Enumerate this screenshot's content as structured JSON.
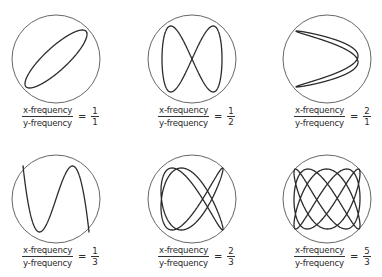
{
  "figure": {
    "stroke_color": "#2b2b2b",
    "circle_color": "#555555"
  },
  "panels": [
    {
      "id": "ratio-1-1",
      "center": [
        56,
        59
      ],
      "radius": 44,
      "numerator_label": "x-frequency",
      "denominator_label": "y-frequency",
      "equals": "=",
      "ratio_num": "1",
      "ratio_den": "1",
      "a": 1,
      "b": 1,
      "phase": 0.55,
      "amp": [
        31,
        29
      ],
      "caption_pos": [
        22,
        105
      ]
    },
    {
      "id": "ratio-1-2",
      "center": [
        192,
        59
      ],
      "radius": 44,
      "numerator_label": "x-frequency",
      "denominator_label": "y-frequency",
      "equals": "=",
      "ratio_num": "1",
      "ratio_den": "2",
      "a": 1,
      "b": 2,
      "phase": 0.0,
      "amp": [
        30,
        33
      ],
      "caption_pos": [
        158,
        105
      ]
    },
    {
      "id": "ratio-2-1",
      "center": [
        327,
        59
      ],
      "radius": 44,
      "numerator_label": "x-frequency",
      "denominator_label": "y-frequency",
      "equals": "=",
      "ratio_num": "2",
      "ratio_den": "1",
      "a": 2,
      "b": 1,
      "phase": 1.35,
      "amp": [
        31,
        28
      ],
      "caption_pos": [
        294,
        105
      ]
    },
    {
      "id": "ratio-1-3",
      "center": [
        56,
        199
      ],
      "radius": 44,
      "numerator_label": "x-frequency",
      "denominator_label": "y-frequency",
      "equals": "=",
      "ratio_num": "1",
      "ratio_den": "3",
      "a": 1,
      "b": 3,
      "phase": 0.0,
      "amp": [
        33,
        33
      ],
      "caption_pos": [
        22,
        245
      ]
    },
    {
      "id": "ratio-2-3",
      "center": [
        192,
        199
      ],
      "radius": 44,
      "numerator_label": "x-frequency",
      "denominator_label": "y-frequency",
      "equals": "=",
      "ratio_num": "2",
      "ratio_den": "3",
      "a": 2,
      "b": 3,
      "phase": 0.35,
      "amp": [
        31,
        31
      ],
      "caption_pos": [
        158,
        245
      ]
    },
    {
      "id": "ratio-5-3",
      "center": [
        327,
        199
      ],
      "radius": 44,
      "numerator_label": "x-frequency",
      "denominator_label": "y-frequency",
      "equals": "=",
      "ratio_num": "5",
      "ratio_den": "3",
      "a": 3,
      "b": 5,
      "phase": 0.3,
      "amp": [
        33,
        30
      ],
      "caption_pos": [
        294,
        245
      ]
    }
  ]
}
